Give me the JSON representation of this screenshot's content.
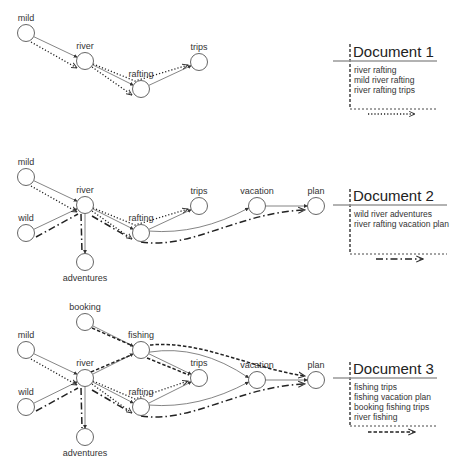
{
  "panels": [
    {
      "id": "doc1",
      "title": "Document 1",
      "lines": [
        "river rafting",
        "mild river rafting",
        "river rafting trips"
      ],
      "path_style": "dotted",
      "box": {
        "x": 350,
        "top": 44,
        "rule_y": 61,
        "rule_x1": 333,
        "rule_x2": 437,
        "bottom": 109,
        "right": 438,
        "legend_y": 114,
        "legend_x1": 368,
        "legend_x2": 415
      },
      "nodes": [
        {
          "id": "mild",
          "label": "mild",
          "x": 26,
          "y": 33
        },
        {
          "id": "river",
          "label": "river",
          "x": 85,
          "y": 61
        },
        {
          "id": "rafting",
          "label": "rafting",
          "x": 141,
          "y": 89
        },
        {
          "id": "trips",
          "label": "trips",
          "x": 199,
          "y": 62
        }
      ],
      "edges": [
        [
          "mild",
          "river"
        ],
        [
          "river",
          "rafting"
        ],
        [
          "rafting",
          "trips"
        ]
      ],
      "paths": [
        {
          "style": "doc1",
          "d": "M31 42 L77 68"
        },
        {
          "style": "doc1",
          "d": "M92 67 L132 95"
        },
        {
          "style": "doc1",
          "d": "M93 64 L135 81 L188 65"
        }
      ]
    },
    {
      "id": "doc2",
      "title": "Document 2",
      "lines": [
        "wild river adventures",
        "river rafting vacation plan"
      ],
      "path_style": "dash-dot",
      "box": {
        "x": 350,
        "top": 189,
        "rule_y": 205,
        "rule_x1": 333,
        "rule_x2": 447,
        "bottom": 254,
        "right": 447,
        "legend_y": 259,
        "legend_x1": 376,
        "legend_x2": 423
      },
      "nodes": [
        {
          "id": "mild",
          "label": "mild",
          "x": 26,
          "y": 177
        },
        {
          "id": "wild",
          "label": "wild",
          "x": 26,
          "y": 233
        },
        {
          "id": "river",
          "label": "river",
          "x": 85,
          "y": 205
        },
        {
          "id": "adventures",
          "label": "adventures",
          "x": 85,
          "y": 262,
          "label_below": true
        },
        {
          "id": "rafting",
          "label": "rafting",
          "x": 141,
          "y": 233
        },
        {
          "id": "trips",
          "label": "trips",
          "x": 199,
          "y": 206
        },
        {
          "id": "vacation",
          "label": "vacation",
          "x": 257,
          "y": 206
        },
        {
          "id": "plan",
          "label": "plan",
          "x": 316,
          "y": 206
        }
      ],
      "edges": [
        [
          "mild",
          "river"
        ],
        [
          "wild",
          "river"
        ],
        [
          "river",
          "adventures"
        ],
        [
          "river",
          "rafting"
        ],
        [
          "rafting",
          "trips"
        ],
        [
          "rafting",
          "vacation"
        ],
        [
          "vacation",
          "plan"
        ]
      ],
      "paths": [
        {
          "style": "doc1",
          "d": "M31 186 L77 212"
        },
        {
          "style": "doc1",
          "d": "M92 211 L132 239"
        },
        {
          "style": "doc1",
          "d": "M93 208 L135 225 L188 209"
        },
        {
          "style": "doc2",
          "d": "M36 237 L78 214 M81 214 L82 253 M92 216 L130 238 M141 242 C190 250, 240 212, 305 210"
        }
      ]
    },
    {
      "id": "doc3",
      "title": "Document 3",
      "lines": [
        "fishing trips",
        "fishing vacation plan",
        "booking fishing trips",
        "river fishing"
      ],
      "path_style": "dashed",
      "box": {
        "x": 350,
        "top": 362,
        "rule_y": 378,
        "rule_x1": 333,
        "rule_x2": 437,
        "bottom": 426,
        "right": 438,
        "legend_y": 432,
        "legend_x1": 368,
        "legend_x2": 415
      },
      "nodes": [
        {
          "id": "booking",
          "label": "booking",
          "x": 85,
          "y": 322
        },
        {
          "id": "mild",
          "label": "mild",
          "x": 26,
          "y": 350
        },
        {
          "id": "fishing",
          "label": "fishing",
          "x": 141,
          "y": 350
        },
        {
          "id": "wild",
          "label": "wild",
          "x": 26,
          "y": 407
        },
        {
          "id": "river",
          "label": "river",
          "x": 85,
          "y": 378
        },
        {
          "id": "adventures",
          "label": "adventures",
          "x": 85,
          "y": 437,
          "label_below": true
        },
        {
          "id": "rafting",
          "label": "rafting",
          "x": 141,
          "y": 407
        },
        {
          "id": "trips",
          "label": "trips",
          "x": 199,
          "y": 378
        },
        {
          "id": "vacation",
          "label": "vacation",
          "x": 257,
          "y": 380
        },
        {
          "id": "plan",
          "label": "plan",
          "x": 316,
          "y": 380
        }
      ],
      "edges": [
        [
          "booking",
          "fishing"
        ],
        [
          "mild",
          "river"
        ],
        [
          "wild",
          "river"
        ],
        [
          "river",
          "fishing"
        ],
        [
          "river",
          "adventures"
        ],
        [
          "river",
          "rafting"
        ],
        [
          "fishing",
          "trips"
        ],
        [
          "rafting",
          "trips"
        ],
        [
          "fishing",
          "vacation"
        ],
        [
          "rafting",
          "vacation"
        ],
        [
          "vacation",
          "plan"
        ]
      ],
      "paths": [
        {
          "style": "doc1",
          "d": "M31 359 L77 385"
        },
        {
          "style": "doc1",
          "d": "M92 384 L132 413"
        },
        {
          "style": "doc1",
          "d": "M93 381 L135 399 L188 381"
        },
        {
          "style": "doc2",
          "d": "M36 411 L78 388 M81 388 L82 428 M92 390 L130 412 M141 416 C190 424, 240 386, 305 384"
        },
        {
          "style": "doc3",
          "d": "M92 328 L133 346 M91 372 L131 355 M147 358 L189 375 M150 345 C200 340, 250 368, 305 376"
        }
      ]
    }
  ],
  "legend_styles": {
    "doc1": "dotted",
    "doc2": "dash-dot",
    "doc3": "dashed"
  }
}
